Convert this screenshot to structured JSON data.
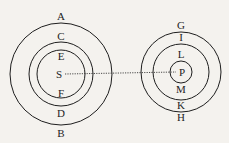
{
  "diagram": {
    "stroke_color": "#1e1e1e",
    "background": "#f4f2ee",
    "left_system": {
      "center_label": "S",
      "outer_top": "A",
      "outer_bottom": "B",
      "middle_top": "C",
      "middle_bottom": "D",
      "inner_top": "E",
      "inner_bottom": "F"
    },
    "right_system": {
      "center_label": "P",
      "outer_top": "G",
      "outer_bottom": "H",
      "middle_top": "I",
      "middle_bottom": "K",
      "inner_top": "L",
      "inner_bottom": "M"
    },
    "connector": "dotted line from S to P"
  }
}
